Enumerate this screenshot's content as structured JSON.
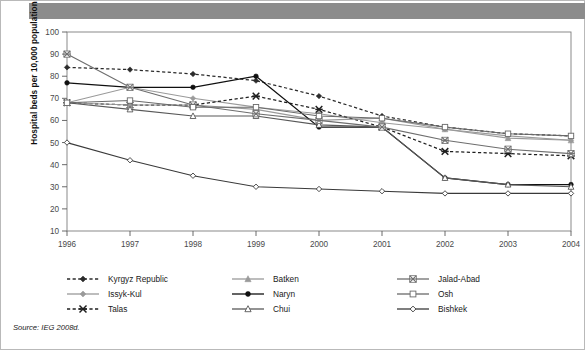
{
  "figure": {
    "source_note": "Source: IEG 2008d.",
    "banner_color": "#8c8c8c",
    "border_color": "#b9b9b9"
  },
  "chart_data": {
    "type": "line",
    "title": "",
    "xlabel": "",
    "ylabel": "Hospital beds per 10,000 population",
    "categories": [
      "1996",
      "1997",
      "1998",
      "1999",
      "2000",
      "2001",
      "2002",
      "2003",
      "2004"
    ],
    "x": [
      1996,
      1997,
      1998,
      1999,
      2000,
      2001,
      2002,
      2003,
      2004
    ],
    "ylim": [
      10,
      100
    ],
    "yticks": [
      10,
      20,
      30,
      40,
      50,
      60,
      70,
      80,
      90,
      100
    ],
    "grid": false,
    "legend_position": "bottom",
    "series": [
      {
        "name": "Kyrgyz Republic",
        "values": [
          84,
          83,
          81,
          78,
          71,
          62,
          57,
          54,
          53
        ],
        "color": "#2b2b2b",
        "linestyle": "dashed",
        "marker": "diamond-filled"
      },
      {
        "name": "Issyk-Kul",
        "values": [
          68,
          75,
          70,
          66,
          63,
          59,
          56,
          53,
          51
        ],
        "color": "#9a9a9a",
        "linestyle": "solid",
        "marker": "diamond-filled"
      },
      {
        "name": "Talas",
        "values": [
          68,
          67,
          67,
          71,
          65,
          57,
          46,
          45,
          44
        ],
        "color": "#1f1f1f",
        "linestyle": "dashed",
        "marker": "star"
      },
      {
        "name": "Batken",
        "values": [
          68,
          67,
          67,
          65,
          60,
          61,
          56,
          52,
          51
        ],
        "color": "#9a9a9a",
        "linestyle": "solid",
        "marker": "triangle-filled"
      },
      {
        "name": "Naryn",
        "values": [
          77,
          75,
          75,
          80,
          57,
          57,
          34,
          31,
          31
        ],
        "color": "#101010",
        "linestyle": "solid",
        "marker": "circle-filled"
      },
      {
        "name": "Chui",
        "values": [
          68,
          65,
          62,
          62,
          58,
          57,
          34,
          31,
          30
        ],
        "color": "#585858",
        "linestyle": "solid",
        "marker": "triangle-open"
      },
      {
        "name": "Jalad-Abad",
        "values": [
          90,
          75,
          67,
          63,
          60,
          57,
          51,
          47,
          45
        ],
        "color": "#6e6e6e",
        "linestyle": "solid",
        "marker": "star-box"
      },
      {
        "name": "Osh",
        "values": [
          68,
          69,
          66,
          66,
          62,
          61,
          57,
          54,
          53
        ],
        "color": "#6a6a6a",
        "linestyle": "solid",
        "marker": "square-open"
      },
      {
        "name": "Bishkek",
        "values": [
          50,
          42,
          35,
          30,
          29,
          28,
          27,
          27,
          27
        ],
        "color": "#3a3a3a",
        "linestyle": "solid",
        "marker": "diamond-open"
      }
    ]
  },
  "legend": {
    "columns": [
      [
        "Kyrgyz Republic",
        "Issyk-Kul",
        "Talas"
      ],
      [
        "Batken",
        "Naryn",
        "Chui"
      ],
      [
        "Jalad-Abad",
        "Osh",
        "Bishkek"
      ]
    ]
  }
}
